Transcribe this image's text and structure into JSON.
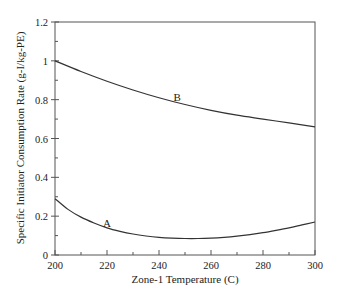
{
  "chart_data": {
    "type": "line",
    "title": "",
    "xlabel": "Zone-1 Temperature (C)",
    "ylabel": "Specific Initiator Consumption Rate (g-I/kg-PE)",
    "xlim": [
      200,
      300
    ],
    "ylim": [
      0,
      1.2
    ],
    "grid": false,
    "legend": "none",
    "x_ticks": [
      200,
      220,
      240,
      260,
      280,
      300
    ],
    "x_tick_labels": [
      "200",
      "220",
      "240",
      "260",
      "280",
      "300"
    ],
    "x_minor_step": 10,
    "y_ticks": [
      0,
      0.2,
      0.4,
      0.6,
      0.8,
      1,
      1.2
    ],
    "y_tick_labels": [
      "0",
      "0.2",
      "0.4",
      "0.6",
      "0.8",
      "1",
      "1.2"
    ],
    "y_minor_step": 0.1,
    "series": [
      {
        "name": "A",
        "label": "A",
        "label_at": [
          220,
          0.145
        ],
        "x": [
          200,
          205,
          210,
          215,
          220,
          225,
          230,
          235,
          240,
          245,
          250,
          255,
          260,
          265,
          270,
          275,
          280,
          285,
          290,
          295,
          300
        ],
        "y": [
          0.29,
          0.235,
          0.195,
          0.165,
          0.14,
          0.122,
          0.108,
          0.098,
          0.091,
          0.087,
          0.085,
          0.085,
          0.087,
          0.091,
          0.097,
          0.105,
          0.115,
          0.127,
          0.14,
          0.155,
          0.17
        ]
      },
      {
        "name": "B",
        "label": "B",
        "label_at": [
          247,
          0.795
        ],
        "x": [
          200,
          210,
          220,
          230,
          240,
          250,
          260,
          270,
          280,
          290,
          300
        ],
        "y": [
          1.0,
          0.945,
          0.895,
          0.85,
          0.81,
          0.775,
          0.745,
          0.72,
          0.7,
          0.68,
          0.66
        ]
      }
    ]
  }
}
